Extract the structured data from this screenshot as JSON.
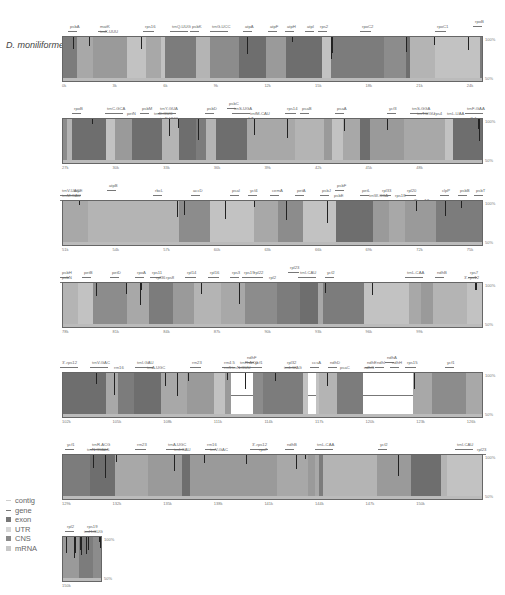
{
  "chart_data": {
    "type": "area",
    "species": "D. moniliforme",
    "ylim": [
      "50%",
      "100%"
    ],
    "y_ticks": [
      "100%",
      "50%"
    ],
    "legend": [
      "contig",
      "gene",
      "exon",
      "UTR",
      "CNS",
      "mRNA"
    ],
    "panels": [
      {
        "x_ticks": [
          "0k",
          "3k",
          "6k",
          "9k",
          "12k",
          "15k",
          "18k",
          "21k",
          "24k"
        ],
        "genes": [
          "psbA",
          "matK",
          "trnK-UUU",
          "rps16",
          "trnQ-UUG",
          "psbK",
          "psbI",
          "trnS-GCU",
          "trnG-UCC",
          "trnR-UCU",
          "atpA",
          "atpF",
          "atpH",
          "atpI",
          "rps2",
          "rpoC2",
          "rpoC1",
          "rpoB"
        ]
      },
      {
        "x_ticks": [
          "27k",
          "30k",
          "33k",
          "36k",
          "39k",
          "42k",
          "45k",
          "48k"
        ],
        "genes": [
          "rpoB",
          "trnC-GCA",
          "petN",
          "psbM",
          "trnD-GUC",
          "trnY-GUA",
          "trnE-UUC",
          "trnT-GGU",
          "psbD",
          "psbC",
          "trnS-UGA",
          "psbZ",
          "trnG-GCC",
          "trnfM-CAU",
          "rps14",
          "psaB",
          "psaA",
          "ycf3",
          "trnS-GGA",
          "rps4",
          "trnT-UGU",
          "trnL-UAA",
          "trnF-GAA",
          "ndhJ",
          "ndhK",
          "ndhC"
        ]
      },
      {
        "x_ticks": [
          "51k",
          "54k",
          "57k",
          "60k",
          "63k",
          "66k",
          "69k",
          "72k",
          "75k"
        ],
        "genes": [
          "trnV-UAC",
          "trnM-CAU",
          "atpE",
          "atpB",
          "rbcL",
          "accD",
          "psaI",
          "ycf4",
          "cemA",
          "petA",
          "psbJ",
          "psbL",
          "psbF",
          "psbE",
          "petL",
          "petG",
          "trnW-CCA",
          "trnP-UGG",
          "psaJ",
          "rpl33",
          "rps18",
          "rpl20",
          "3'-rps12",
          "clpP",
          "psbB",
          "psbT",
          "psbN",
          "psbH"
        ]
      },
      {
        "x_ticks": [
          "78k",
          "81k",
          "84k",
          "87k",
          "90k",
          "93k",
          "96k",
          "99k"
        ],
        "genes": [
          "petB",
          "petD",
          "rpoA",
          "rps11",
          "rpl36",
          "rps8",
          "rpl14",
          "rpl16",
          "rps3",
          "rpl22",
          "rps19",
          "rpl2",
          "rpl23",
          "trnI-CAU",
          "ycf2",
          "trnL-CAA",
          "ndhB",
          "rps7",
          "3'-rps12"
        ]
      },
      {
        "x_ticks": [
          "102k",
          "105k",
          "108k",
          "111k",
          "114k",
          "117k",
          "120k",
          "123k",
          "126k"
        ],
        "genes": [
          "3'-rps12",
          "trnV-GAC",
          "rrn16",
          "trnI-GAU",
          "trnA-UGC",
          "rrn23",
          "rrn4.5",
          "rrn5",
          "trnR-ACG",
          "trnN-GUU",
          "ycf1",
          "ndhF",
          "rpl32",
          "trnL-UAG",
          "ccsA",
          "ndhD",
          "psaC",
          "ndhE",
          "ndhG",
          "ndhI",
          "ndhA",
          "ndhH",
          "rps15",
          "ycf1"
        ]
      },
      {
        "x_ticks": [
          "129k",
          "132k",
          "135k",
          "138k",
          "141k",
          "144k",
          "147k",
          "150k"
        ],
        "genes": [
          "ycf1",
          "trnN-GUU",
          "trnR-ACG",
          "rrn5",
          "rrn4.5",
          "rrn23",
          "trnA-UGC",
          "trnI-GAU",
          "rrn16",
          "trnV-GAC",
          "3'-rps12",
          "rps7",
          "ndhB",
          "trnL-CAA",
          "ycf2",
          "trnI-CAU",
          "rpl23"
        ]
      },
      {
        "x_ticks": [
          "150k"
        ],
        "genes": [
          "rpl2",
          "rps19",
          "trnH-GUG"
        ]
      }
    ],
    "highlight_low_identity_regions": [
      "~110-113k (ndhF / rpl32 intergenic)",
      "~118-121k (ndhA-ndhH intergenic)"
    ]
  },
  "labels": {
    "species": "D. moniliforme",
    "y_top": "100%",
    "y_bottom": "50%"
  },
  "legend": [
    {
      "label": "contig",
      "color": "#cfcfcf"
    },
    {
      "label": "gene",
      "color": "#888888"
    },
    {
      "label": "exon",
      "color": "#777777"
    },
    {
      "label": "UTR",
      "color": "#d6d6d6"
    },
    {
      "label": "CNS",
      "color": "#8a8a8a"
    },
    {
      "label": "mRNA",
      "color": "#c8c8c8"
    }
  ],
  "panels": [
    {
      "top": 20,
      "ticks": [
        "0k",
        "3k",
        "6k",
        "9k",
        "12k",
        "15k",
        "18k",
        "21k",
        "24k"
      ],
      "genes": [
        {
          "t": "psbA",
          "x": 8
        },
        {
          "t": "matK",
          "x": 38,
          "row": 0
        },
        {
          "t": "trnK-UUU",
          "x": 38,
          "row": 1
        },
        {
          "t": "rps16",
          "x": 83
        },
        {
          "t": "trnQ-UUG",
          "x": 110
        },
        {
          "t": "psbK",
          "x": 130
        },
        {
          "t": "trnG-UCC",
          "x": 150
        },
        {
          "t": "atpA",
          "x": 183
        },
        {
          "t": "atpF",
          "x": 208
        },
        {
          "t": "atpH",
          "x": 225
        },
        {
          "t": "atpI",
          "x": 245
        },
        {
          "t": "rps2",
          "x": 258
        },
        {
          "t": "rpoC2",
          "x": 300
        },
        {
          "t": "rpoC1",
          "x": 375
        },
        {
          "t": "rpoB",
          "x": 413,
          "row": -1
        }
      ]
    },
    {
      "top": 102,
      "ticks": [
        "27k",
        "30k",
        "33k",
        "36k",
        "39k",
        "42k",
        "45k",
        "48k"
      ],
      "genes": [
        {
          "t": "rpoB",
          "x": 12
        },
        {
          "t": "trnC-GCA",
          "x": 45
        },
        {
          "t": "petN",
          "x": 65,
          "row": 1
        },
        {
          "t": "psbM",
          "x": 80
        },
        {
          "t": "trnY-GUA",
          "x": 98
        },
        {
          "t": "trnD-GUC",
          "x": 92,
          "row": 1
        },
        {
          "t": "trnE-UUC",
          "x": 98,
          "row": 2
        },
        {
          "t": "psbD",
          "x": 145
        },
        {
          "t": "psbC",
          "x": 167,
          "row": -1
        },
        {
          "t": "trnS-UGA",
          "x": 172
        },
        {
          "t": "trnfM-CAU",
          "x": 188,
          "row": 1
        },
        {
          "t": "psbZ",
          "x": 182,
          "row": 2
        },
        {
          "t": "rps14",
          "x": 225
        },
        {
          "t": "psaB",
          "x": 240
        },
        {
          "t": "psaA",
          "x": 275
        },
        {
          "t": "ycf3",
          "x": 327
        },
        {
          "t": "trnS-GGA",
          "x": 350
        },
        {
          "t": "trnT-UGU",
          "x": 355,
          "row": 1
        },
        {
          "t": "rps4",
          "x": 372,
          "row": 1
        },
        {
          "t": "trnF-GAA",
          "x": 405
        },
        {
          "t": "trnL-UAA",
          "x": 385,
          "row": 1
        },
        {
          "t": "ndhJ",
          "x": 405,
          "row": 2
        }
      ]
    },
    {
      "top": 184,
      "ticks": [
        "51k",
        "54k",
        "57k",
        "60k",
        "63k",
        "66k",
        "69k",
        "72k",
        "75k"
      ],
      "genes": [
        {
          "t": "atpB",
          "x": 47,
          "row": -1
        },
        {
          "t": "trnV-UAC",
          "x": 0
        },
        {
          "t": "atpE",
          "x": 12
        },
        {
          "t": "trnM-CAU",
          "x": 0,
          "row": 1
        },
        {
          "t": "rbcL",
          "x": 93
        },
        {
          "t": "accD",
          "x": 131
        },
        {
          "t": "psaI",
          "x": 170
        },
        {
          "t": "ycf4",
          "x": 188
        },
        {
          "t": "cemA",
          "x": 210
        },
        {
          "t": "petA",
          "x": 235
        },
        {
          "t": "psbJ",
          "x": 260
        },
        {
          "t": "psbF",
          "x": 275,
          "row": -1
        },
        {
          "t": "psbE",
          "x": 272,
          "row": 1
        },
        {
          "t": "petL",
          "x": 300
        },
        {
          "t": "trnW-CCA",
          "x": 307,
          "row": 1
        },
        {
          "t": "rpl33",
          "x": 320
        },
        {
          "t": "rpl20",
          "x": 345
        },
        {
          "t": "rps18",
          "x": 333,
          "row": 1
        },
        {
          "t": "3'-rps12",
          "x": 352,
          "row": 2
        },
        {
          "t": "clpP",
          "x": 380
        },
        {
          "t": "psbB",
          "x": 398
        },
        {
          "t": "psbT",
          "x": 414
        }
      ]
    },
    {
      "top": 266,
      "ticks": [
        "78k",
        "81k",
        "84k",
        "87k",
        "90k",
        "93k",
        "96k",
        "99k"
      ],
      "genes": [
        {
          "t": "psbH",
          "x": 0
        },
        {
          "t": "psbN",
          "x": 0,
          "row": 1
        },
        {
          "t": "petB",
          "x": 22
        },
        {
          "t": "petD",
          "x": 50
        },
        {
          "t": "rpoA",
          "x": 75
        },
        {
          "t": "rps11",
          "x": 90
        },
        {
          "t": "rpl36",
          "x": 94,
          "row": 1
        },
        {
          "t": "rps8",
          "x": 104,
          "row": 1
        },
        {
          "t": "rpl14",
          "x": 125
        },
        {
          "t": "rpl16",
          "x": 148
        },
        {
          "t": "rps3",
          "x": 170
        },
        {
          "t": "rps19",
          "x": 182
        },
        {
          "t": "rpl22",
          "x": 192
        },
        {
          "t": "rpl2",
          "x": 207,
          "row": 1
        },
        {
          "t": "rpl23",
          "x": 228,
          "row": -1
        },
        {
          "t": "trnI-CAU",
          "x": 238
        },
        {
          "t": "ycf2",
          "x": 265
        },
        {
          "t": "trnL-CAA",
          "x": 345
        },
        {
          "t": "ndhB",
          "x": 375
        },
        {
          "t": "rps7",
          "x": 408
        },
        {
          "t": "3'-rps12",
          "x": 402,
          "row": 1
        }
      ]
    },
    {
      "top": 356,
      "ticks": [
        "102k",
        "105k",
        "108k",
        "111k",
        "114k",
        "117k",
        "120k",
        "123k",
        "126k"
      ],
      "genes": [
        {
          "t": "3'-rps12",
          "x": 0
        },
        {
          "t": "trnV-GAC",
          "x": 30
        },
        {
          "t": "rrn16",
          "x": 52,
          "row": 1
        },
        {
          "t": "trnI-GAU",
          "x": 75
        },
        {
          "t": "trnA-UGC",
          "x": 85,
          "row": 1
        },
        {
          "t": "rrn23",
          "x": 130
        },
        {
          "t": "rrn4.5",
          "x": 162
        },
        {
          "t": "rrn5",
          "x": 162,
          "row": 1
        },
        {
          "t": "trnR-ACG",
          "x": 178
        },
        {
          "t": "trnN-GUU",
          "x": 170,
          "row": 1
        },
        {
          "t": "ndhF",
          "x": 185,
          "row": -1
        },
        {
          "t": "ycf1",
          "x": 193
        },
        {
          "t": "rpl32",
          "x": 225
        },
        {
          "t": "trnL-UAG",
          "x": 222,
          "row": 1
        },
        {
          "t": "ccsA",
          "x": 250
        },
        {
          "t": "ndhD",
          "x": 268
        },
        {
          "t": "psaC",
          "x": 278,
          "row": 1
        },
        {
          "t": "ndhE",
          "x": 305
        },
        {
          "t": "ndhG",
          "x": 302,
          "row": 1
        },
        {
          "t": "ndhI",
          "x": 315
        },
        {
          "t": "ndhA",
          "x": 325,
          "row": -1
        },
        {
          "t": "ndhH",
          "x": 330
        },
        {
          "t": "rps15",
          "x": 345
        },
        {
          "t": "ycf1",
          "x": 385
        }
      ]
    },
    {
      "top": 438,
      "ticks": [
        "129k",
        "132k",
        "135k",
        "138k",
        "141k",
        "144k",
        "147k",
        "150k"
      ],
      "genes": [
        {
          "t": "ycf1",
          "x": 5
        },
        {
          "t": "trnR-ACG",
          "x": 30
        },
        {
          "t": "trnN-GUU",
          "x": 25,
          "row": 1
        },
        {
          "t": "rrn5",
          "x": 40,
          "row": 1
        },
        {
          "t": "rrn23",
          "x": 75
        },
        {
          "t": "trnA-UGC",
          "x": 106
        },
        {
          "t": "trnI-GAU",
          "x": 112,
          "row": 1
        },
        {
          "t": "rrn16",
          "x": 145
        },
        {
          "t": "trnV-GAC",
          "x": 148,
          "row": 1
        },
        {
          "t": "3'-rps12",
          "x": 190
        },
        {
          "t": "rps7",
          "x": 197,
          "row": 1
        },
        {
          "t": "ndhB",
          "x": 225
        },
        {
          "t": "trnL-CAA",
          "x": 255
        },
        {
          "t": "ycf2",
          "x": 318
        },
        {
          "t": "trnI-CAU",
          "x": 395
        },
        {
          "t": "rpl23",
          "x": 415,
          "row": 1
        }
      ]
    },
    {
      "top": 520,
      "ticks": [
        "150k"
      ],
      "genes": [
        {
          "t": "rpl2",
          "x": 5
        },
        {
          "t": "rps19",
          "x": 25
        },
        {
          "t": "trnH-GUG",
          "x": 22,
          "row": 1
        }
      ]
    }
  ]
}
